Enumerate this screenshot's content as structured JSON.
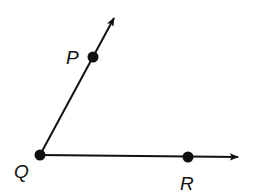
{
  "diagram": {
    "type": "angle",
    "vertex": {
      "label": "Q",
      "x": 40,
      "y": 155
    },
    "rays": [
      {
        "name": "ray-QP",
        "from": "Q",
        "through": "P",
        "point": {
          "label": "P",
          "x": 93,
          "y": 57
        },
        "tip": {
          "x": 115,
          "y": 16
        }
      },
      {
        "name": "ray-QR",
        "from": "Q",
        "through": "R",
        "point": {
          "label": "R",
          "x": 188,
          "y": 157
        },
        "tip": {
          "x": 240,
          "y": 157
        }
      }
    ],
    "labels": {
      "P": "P",
      "Q": "Q",
      "R": "R"
    },
    "colors": {
      "stroke": "#111111",
      "background": "#ffffff"
    }
  }
}
